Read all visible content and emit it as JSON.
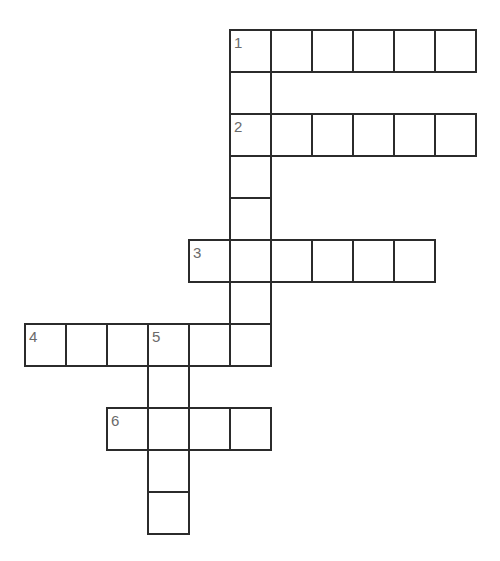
{
  "puzzle": {
    "type": "crossword",
    "grid_origin": {
      "x": 25,
      "y": 30
    },
    "cell_width": 41,
    "cell_height": 42,
    "colors": {
      "line": "#2b2b2b",
      "number": "#6a6a6a",
      "background": "#ffffff"
    },
    "entries": [
      {
        "number": "1",
        "direction": "across",
        "row": 0,
        "col": 5,
        "length": 6
      },
      {
        "number": "1",
        "direction": "down",
        "row": 0,
        "col": 5,
        "length": 8
      },
      {
        "number": "2",
        "direction": "across",
        "row": 2,
        "col": 5,
        "length": 6
      },
      {
        "number": "3",
        "direction": "across",
        "row": 5,
        "col": 4,
        "length": 6
      },
      {
        "number": "4",
        "direction": "across",
        "row": 7,
        "col": 0,
        "length": 6
      },
      {
        "number": "5",
        "direction": "down",
        "row": 7,
        "col": 3,
        "length": 5
      },
      {
        "number": "6",
        "direction": "across",
        "row": 9,
        "col": 2,
        "length": 4
      }
    ],
    "numbered_cells": [
      {
        "label": "1",
        "row": 0,
        "col": 5
      },
      {
        "label": "2",
        "row": 2,
        "col": 5
      },
      {
        "label": "3",
        "row": 5,
        "col": 4
      },
      {
        "label": "4",
        "row": 7,
        "col": 0
      },
      {
        "label": "5",
        "row": 7,
        "col": 3
      },
      {
        "label": "6",
        "row": 9,
        "col": 2
      }
    ]
  }
}
